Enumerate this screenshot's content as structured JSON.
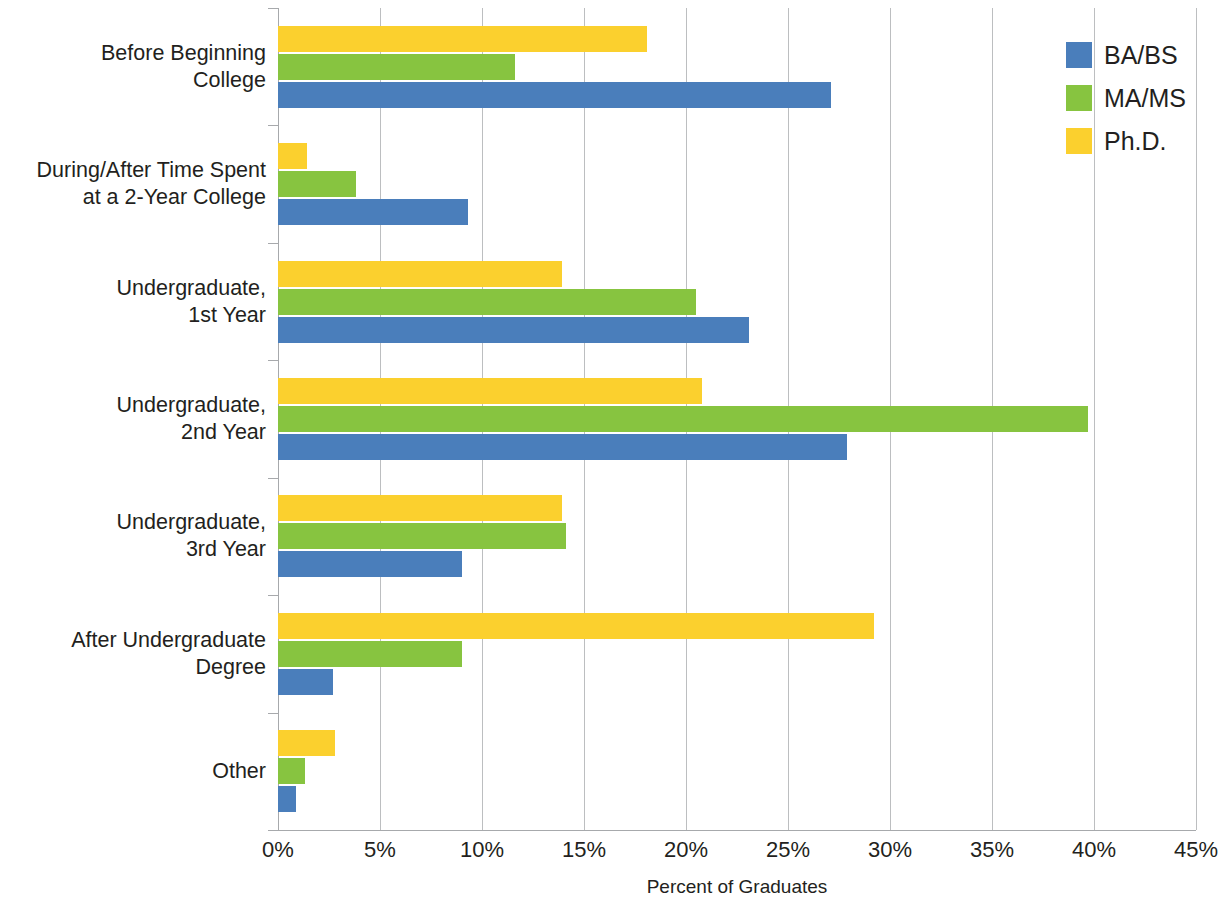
{
  "chart_data": {
    "type": "bar",
    "orientation": "horizontal",
    "title": "",
    "xlabel": "Percent of Graduates",
    "ylabel": "",
    "xlim": [
      0,
      45
    ],
    "xticks": [
      0,
      5,
      10,
      15,
      20,
      25,
      30,
      35,
      40,
      45
    ],
    "xtick_labels": [
      "0%",
      "5%",
      "10%",
      "15%",
      "20%",
      "25%",
      "30%",
      "35%",
      "40%",
      "45%"
    ],
    "grid": "vertical",
    "legend_position": "top-right",
    "categories": [
      "Before Beginning\nCollege",
      "During/After Time Spent\nat a 2-Year College",
      "Undergraduate,\n1st Year",
      "Undergraduate,\n2nd Year",
      "Undergraduate,\n3rd Year",
      "After Undergraduate\nDegree",
      "Other"
    ],
    "series": [
      {
        "name": "BA/BS",
        "color": "#4a7ebb",
        "values": [
          27.1,
          9.3,
          23.1,
          27.9,
          9.0,
          2.7,
          0.9
        ]
      },
      {
        "name": "MA/MS",
        "color": "#87c440",
        "values": [
          11.6,
          3.8,
          20.5,
          39.7,
          14.1,
          9.0,
          1.3
        ]
      },
      {
        "name": "Ph.D.",
        "color": "#fbd02e",
        "values": [
          18.1,
          1.4,
          13.9,
          20.8,
          13.9,
          29.2,
          2.8
        ]
      }
    ]
  },
  "legend": {
    "items": [
      {
        "label": "BA/BS",
        "color": "#4a7ebb"
      },
      {
        "label": "MA/MS",
        "color": "#87c440"
      },
      {
        "label": "Ph.D.",
        "color": "#fbd02e"
      }
    ]
  },
  "axis": {
    "x_title": "Percent of Graduates"
  }
}
